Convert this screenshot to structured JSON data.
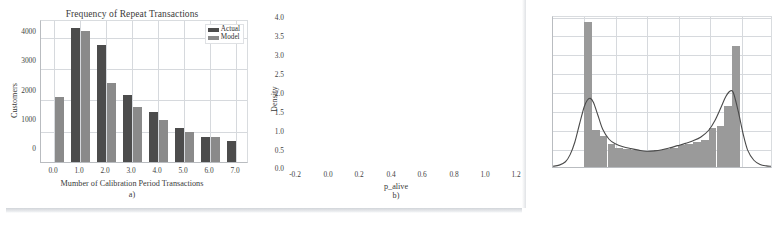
{
  "figure": {
    "panels": [
      "a)",
      "b)"
    ],
    "colors": {
      "actual": "#4c4c4c",
      "model": "#8a8a8a",
      "histogram": "#9a9a9a",
      "kde_curve": "#4a4a4a",
      "grid": "#d6d9dd",
      "axis": "#b9bcc0",
      "background": "#ffffff"
    }
  },
  "panel_a": {
    "caption": "a)",
    "legend": {
      "position": "top-right",
      "entries": [
        {
          "label": "Actual",
          "color": "#4c4c4c"
        },
        {
          "label": "Model",
          "color": "#8a8a8a"
        }
      ]
    }
  },
  "panel_b": {
    "caption": "b)"
  },
  "chart_data": [
    {
      "type": "bar",
      "panel": "a)",
      "title": "Frequency of Repeat Transactions",
      "xlabel": "Mumber of Calibration Period Transactions",
      "ylabel": "Customers",
      "categories": [
        "0.0",
        "1.0",
        "2.0",
        "3.0",
        "4.0",
        "5.0",
        "6.0",
        "7.0"
      ],
      "xticks": [
        "0.0",
        "1.0",
        "2.0",
        "3.0",
        "4.0",
        "5.0",
        "6.0",
        "7.0"
      ],
      "yticks": [
        "0",
        "1000",
        "2000",
        "3000",
        "4000"
      ],
      "ylim": [
        0,
        4600
      ],
      "xlim": [
        -0.5,
        7.5
      ],
      "grid": true,
      "legend_position": "upper right",
      "series": [
        {
          "name": "Actual",
          "color": "#4c4c4c",
          "values": [
            null,
            4360,
            3830,
            2190,
            1620,
            1100,
            830,
            680
          ]
        },
        {
          "name": "Model",
          "color": "#8a8a8a",
          "values": [
            2120,
            4270,
            2580,
            1780,
            1380,
            990,
            800,
            null
          ]
        }
      ]
    },
    {
      "type": "histogram",
      "panel": "b)",
      "title": "",
      "xlabel": "p_alive",
      "ylabel": "Density",
      "xticks": [
        "-0.2",
        "0.0",
        "0.2",
        "0.4",
        "0.6",
        "0.8",
        "1.0",
        "1.2"
      ],
      "yticks": [
        "0.0",
        "0.5",
        "1.0",
        "1.5",
        "2.0",
        "2.5",
        "3.0",
        "3.5",
        "4.0"
      ],
      "xlim": [
        -0.2,
        1.2
      ],
      "ylim": [
        0.0,
        4.0
      ],
      "grid": true,
      "bin_width": 0.05,
      "bin_left_edges": [
        0.0,
        0.05,
        0.1,
        0.15,
        0.2,
        0.25,
        0.3,
        0.35,
        0.4,
        0.45,
        0.5,
        0.55,
        0.6,
        0.65,
        0.7,
        0.75,
        0.8,
        0.85,
        0.9,
        0.95
      ],
      "bin_densities": [
        3.86,
        1.0,
        0.82,
        0.62,
        0.52,
        0.48,
        0.45,
        0.43,
        0.42,
        0.45,
        0.48,
        0.52,
        0.58,
        0.62,
        0.68,
        0.72,
        1.04,
        1.1,
        1.62,
        3.23
      ],
      "overlay_curve": {
        "name": "kde",
        "color": "#4a4a4a",
        "x": [
          -0.2,
          -0.16,
          -0.12,
          -0.09,
          -0.06,
          -0.03,
          0.0,
          0.02,
          0.04,
          0.06,
          0.09,
          0.12,
          0.16,
          0.2,
          0.25,
          0.3,
          0.35,
          0.4,
          0.45,
          0.5,
          0.55,
          0.6,
          0.65,
          0.7,
          0.75,
          0.8,
          0.84,
          0.88,
          0.91,
          0.94,
          0.96,
          0.99,
          1.02,
          1.05,
          1.09,
          1.13,
          1.17,
          1.2
        ],
        "y": [
          0.02,
          0.05,
          0.14,
          0.33,
          0.66,
          1.14,
          1.6,
          1.78,
          1.83,
          1.72,
          1.36,
          1.0,
          0.74,
          0.62,
          0.54,
          0.49,
          0.45,
          0.42,
          0.43,
          0.46,
          0.51,
          0.57,
          0.63,
          0.7,
          0.8,
          0.98,
          1.24,
          1.6,
          1.88,
          2.03,
          1.96,
          1.48,
          0.9,
          0.45,
          0.18,
          0.07,
          0.03,
          0.02
        ]
      }
    }
  ]
}
